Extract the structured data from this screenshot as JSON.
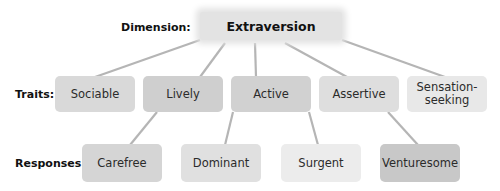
{
  "diagram": {
    "row_labels": {
      "dimension": "Dimension:",
      "traits": "Traits:",
      "responses": "Responses:"
    },
    "dimension": {
      "label": "Extraversion",
      "color": "#e3e3e3"
    },
    "traits": [
      {
        "label": "Sociable",
        "color": "#d9d9d9"
      },
      {
        "label": "Lively",
        "color": "#cfcfcf"
      },
      {
        "label": "Active",
        "color": "#d1d1d1"
      },
      {
        "label": "Assertive",
        "color": "#dedede"
      },
      {
        "label": "Sensation-\nseeking",
        "color": "#e8e8e8"
      }
    ],
    "responses": [
      {
        "label": "Carefree",
        "parent": "Lively",
        "color": "#d5d5d5"
      },
      {
        "label": "Dominant",
        "parent": "Active",
        "color": "#e0e0e0"
      },
      {
        "label": "Surgent",
        "parent": "Active",
        "color": "#ececec"
      },
      {
        "label": "Venturesome",
        "parent": "Assertive",
        "color": "#c8c8c8"
      }
    ],
    "line_color": "#b5b5b5"
  }
}
